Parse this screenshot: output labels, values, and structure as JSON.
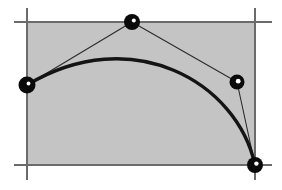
{
  "figure": {
    "width": 282,
    "height": 190,
    "background_color": "#ffffff"
  },
  "colors": {
    "background": "#ffffff",
    "hull_fill": "#c4c4c4",
    "hull_stroke": "#555555",
    "axis_line": "#6b6b6b",
    "curve": "#141414",
    "polygon_line": "#2b2b2b",
    "point_fill": "#0a0a0a",
    "point_highlight": "#ffffff"
  },
  "hull_rect": {
    "x": 27,
    "y": 22,
    "width": 228,
    "height": 143,
    "fill": "#c4c4c4",
    "stroke": "#555555",
    "stroke_width": 1
  },
  "guide_lines": [
    {
      "name": "top-horizontal-guide",
      "x1": 14,
      "y1": 22,
      "x2": 272,
      "y2": 22
    },
    {
      "name": "bottom-horizontal-guide",
      "x1": 14,
      "y1": 165,
      "x2": 272,
      "y2": 165
    },
    {
      "name": "left-vertical-guide",
      "x1": 27,
      "y1": 8,
      "x2": 27,
      "y2": 180
    },
    {
      "name": "right-vertical-guide",
      "x1": 255,
      "y1": 8,
      "x2": 255,
      "y2": 180
    }
  ],
  "control_points": [
    {
      "label": "P0",
      "x": 27,
      "y": 85,
      "radius": 8.5,
      "highlight_dx": 1.5,
      "highlight_dy": -1.5,
      "highlight_r": 1.9
    },
    {
      "label": "P1",
      "x": 132,
      "y": 22,
      "radius": 8.0,
      "highlight_dx": 1.8,
      "highlight_dy": -1.6,
      "highlight_r": 2.0
    },
    {
      "label": "P2",
      "x": 237,
      "y": 82,
      "radius": 7.5,
      "highlight_dx": 1.2,
      "highlight_dy": -0.8,
      "highlight_r": 2.4
    },
    {
      "label": "P3",
      "x": 255,
      "y": 165,
      "radius": 8.0,
      "highlight_dx": 1.4,
      "highlight_dy": -1.4,
      "highlight_r": 2.2
    }
  ],
  "control_polygon": {
    "name": "control-polygon",
    "points": "27,85 132,22 237,82 255,165",
    "stroke_width": 1.1
  },
  "bezier_curve": {
    "name": "cubic-bezier-curve",
    "type": "cubic",
    "start": {
      "x": 27,
      "y": 85
    },
    "control1": {
      "x": 132,
      "y": 22
    },
    "control2": {
      "x": 237,
      "y": 82
    },
    "end": {
      "x": 255,
      "y": 165
    },
    "path": "M 27 85 C 132 22 237 82 255 165",
    "stroke_width": 3.4
  },
  "chart_data": {
    "type": "line",
    "xlabel": "",
    "ylabel": "",
    "xlim": [
      0,
      282
    ],
    "ylim": [
      0,
      190
    ],
    "grid": false,
    "legend": "none",
    "series": [
      {
        "name": "control-polygon",
        "x": [
          27,
          132,
          237,
          255
        ],
        "y": [
          85,
          22,
          82,
          165
        ]
      },
      {
        "name": "cubic-bezier-curve",
        "x": [
          27,
          132,
          237,
          255
        ],
        "y": [
          85,
          22,
          82,
          165
        ]
      }
    ],
    "annotations": [
      {
        "text": "P0",
        "x": 27,
        "y": 85
      },
      {
        "text": "P1",
        "x": 132,
        "y": 22
      },
      {
        "text": "P2",
        "x": 237,
        "y": 82
      },
      {
        "text": "P3",
        "x": 255,
        "y": 165
      }
    ]
  }
}
